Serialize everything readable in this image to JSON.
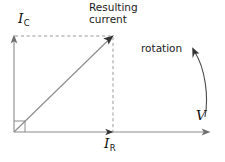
{
  "diagram": {
    "type": "phasor-diagram",
    "background_color": "#ffffff",
    "stroke_color": "#8a8a8a",
    "text_color": "#1b1b1b",
    "labels": {
      "vertical_axis": {
        "symbol": "I",
        "subscript": "C"
      },
      "horizontal_axis_marker": {
        "symbol": "I",
        "subscript": "R"
      },
      "horizontal_axis": {
        "symbol": "V",
        "subscript": ""
      },
      "resultant_line1": "Resulting",
      "resultant_line2": "current",
      "rotation": "rotation"
    },
    "geometry": {
      "origin": {
        "x": 14,
        "y": 132
      },
      "vertical_axis_top": {
        "x": 14,
        "y": 36
      },
      "horizontal_axis_right": {
        "x": 210,
        "y": 132
      },
      "resultant_tip": {
        "x": 113,
        "y": 36
      },
      "ir_marker": {
        "x": 113,
        "y": 132
      },
      "right_angle_box_size": 11,
      "rotation_direction": "counterclockwise"
    }
  }
}
